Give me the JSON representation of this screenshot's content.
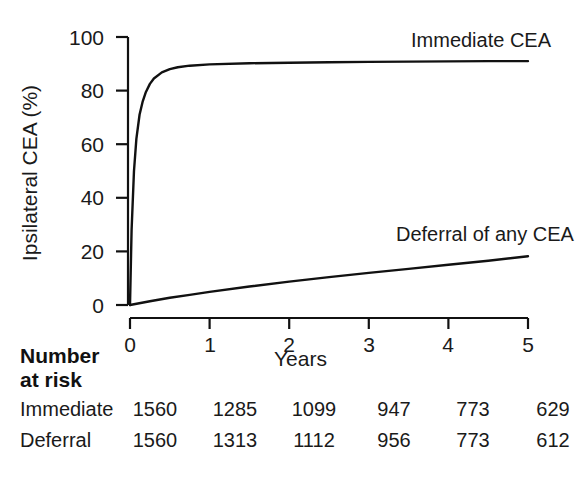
{
  "chart_data": {
    "type": "line",
    "title": "",
    "xlabel": "Years",
    "ylabel": "Ipsilateral CEA (%)",
    "xlim": [
      0,
      5
    ],
    "ylim": [
      0,
      100
    ],
    "grid": false,
    "legend_position": "inline-annotation",
    "x_ticks": [
      "0",
      "1",
      "2",
      "3",
      "4",
      "5"
    ],
    "y_ticks": [
      "0",
      "20",
      "40",
      "60",
      "80",
      "100"
    ],
    "series": [
      {
        "name": "Immediate CEA",
        "annotation": "Immediate CEA",
        "x": [
          0,
          0.02,
          0.05,
          0.08,
          0.12,
          0.16,
          0.2,
          0.25,
          0.3,
          0.4,
          0.5,
          0.6,
          0.75,
          1.0,
          1.5,
          2.0,
          2.5,
          3.0,
          3.5,
          4.0,
          4.5,
          5.0
        ],
        "values": [
          0,
          28,
          50,
          62,
          71,
          76,
          79.5,
          82.5,
          84.5,
          86.8,
          88.0,
          88.7,
          89.3,
          89.8,
          90.2,
          90.4,
          90.6,
          90.7,
          90.8,
          90.9,
          91.0,
          91.0
        ]
      },
      {
        "name": "Deferral of any CEA",
        "annotation": "Deferral of any CEA",
        "x": [
          0,
          0.25,
          0.5,
          0.75,
          1.0,
          1.5,
          2.0,
          2.5,
          3.0,
          3.5,
          4.0,
          4.5,
          5.0
        ],
        "values": [
          0,
          1.4,
          2.7,
          3.8,
          4.9,
          6.9,
          8.7,
          10.4,
          12.0,
          13.5,
          15.0,
          16.5,
          18.2
        ]
      }
    ]
  },
  "risk_table": {
    "heading_line1": "Number",
    "heading_line2": "at risk",
    "rows": [
      {
        "label": "Immediate",
        "values": [
          "1560",
          "1285",
          "1099",
          "947",
          "773",
          "629"
        ]
      },
      {
        "label": "Deferral",
        "values": [
          "1560",
          "1313",
          "1112",
          "956",
          "773",
          "612"
        ]
      }
    ]
  },
  "colors": {
    "line": "#111111",
    "axis": "#111111",
    "text": "#1a1a1a",
    "background": "#ffffff"
  }
}
